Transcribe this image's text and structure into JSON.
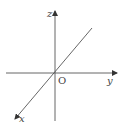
{
  "diagram": {
    "origin": {
      "label": "O",
      "x": 55,
      "y": 73
    },
    "axes": [
      {
        "name": "z",
        "label": "z",
        "direction": "up"
      },
      {
        "name": "y",
        "label": "y",
        "direction": "right"
      },
      {
        "name": "x",
        "label": "x",
        "direction": "down-left"
      }
    ],
    "colors": {
      "line": "#555555",
      "text": "#444444",
      "background": "#ffffff"
    }
  }
}
